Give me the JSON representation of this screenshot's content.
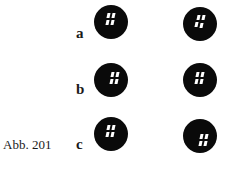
{
  "figure": {
    "caption": "Abb. 201",
    "rows": [
      {
        "label": "a"
      },
      {
        "label": "b"
      },
      {
        "label": "c"
      }
    ]
  }
}
